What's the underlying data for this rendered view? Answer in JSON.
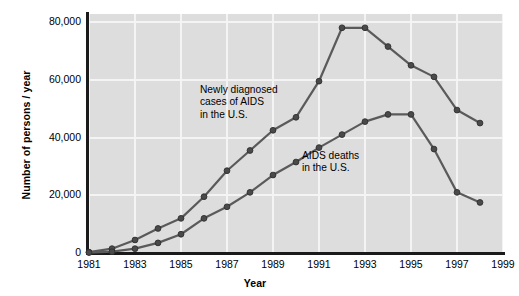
{
  "chart_data": {
    "type": "line",
    "title": "",
    "xlabel": "Year",
    "ylabel": "Number of persons / year",
    "xlim": [
      1981,
      1999
    ],
    "ylim": [
      0,
      80000
    ],
    "grid": true,
    "legend_position": "none (inline annotations)",
    "x": [
      1981,
      1982,
      1983,
      1984,
      1985,
      1986,
      1987,
      1988,
      1989,
      1990,
      1991,
      1992,
      1993,
      1994,
      1995,
      1996,
      1997,
      1998
    ],
    "xticks": [
      "1981",
      "1983",
      "1985",
      "1987",
      "1989",
      "1991",
      "1993",
      "1995",
      "1997",
      "1999"
    ],
    "xtick_values": [
      1981,
      1983,
      1985,
      1987,
      1989,
      1991,
      1993,
      1995,
      1997,
      1999
    ],
    "yticks": [
      "0",
      "20,000",
      "40,000",
      "60,000",
      "80,000"
    ],
    "ytick_values": [
      0,
      20000,
      40000,
      60000,
      80000
    ],
    "series": [
      {
        "name": "Newly diagnosed cases of AIDS in the U.S.",
        "color": "#5a5a5a",
        "values": [
          300,
          1500,
          4500,
          8500,
          12000,
          19500,
          28500,
          35500,
          42500,
          47000,
          59500,
          78000,
          78000,
          71500,
          65000,
          61000,
          49500,
          45000
        ]
      },
      {
        "name": "AIDS deaths in the U.S.",
        "color": "#5a5a5a",
        "values": [
          150,
          450,
          1500,
          3500,
          6500,
          12000,
          16000,
          21000,
          27000,
          31500,
          36500,
          41000,
          45500,
          48000,
          48000,
          36000,
          21000,
          17500
        ]
      }
    ],
    "annotations": [
      {
        "id": "cases",
        "lines": [
          "Newly diagnosed",
          "cases of AIDS",
          "in the U.S."
        ]
      },
      {
        "id": "deaths",
        "lines": [
          "AIDS deaths",
          "in the U.S."
        ]
      }
    ],
    "colors": {
      "panel_background": "#dddddd",
      "grid": "#f4f4f4",
      "axis": "#1a1a1a",
      "line": "#5a5a5a",
      "marker": "#4a4a4a",
      "figure_background": "#ffffff"
    }
  }
}
